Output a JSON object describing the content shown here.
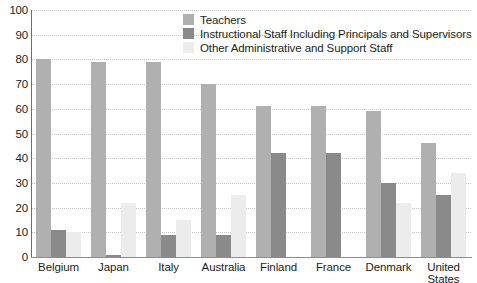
{
  "chart_data": {
    "type": "bar",
    "title": "",
    "xlabel": "",
    "ylabel": "",
    "ylim": [
      0,
      100
    ],
    "yticks": [
      0,
      10,
      20,
      30,
      40,
      50,
      60,
      70,
      80,
      90,
      100
    ],
    "grid": true,
    "legend_position": "top-center",
    "categories": [
      "Belgium",
      "Japan",
      "Italy",
      "Australia",
      "Finland",
      "France",
      "Denmark",
      "United States"
    ],
    "series": [
      {
        "name": "Teachers",
        "color": "#b0b0b0",
        "values": [
          80,
          79,
          79,
          70,
          61,
          61,
          59,
          46
        ]
      },
      {
        "name": "Instructional Staff Including Principals and Supervisors",
        "color": "#8a8a8a",
        "values": [
          11,
          1,
          9,
          9,
          42,
          42,
          30,
          25
        ]
      },
      {
        "name": "Other Administrative and Support Staff",
        "color": "#ececec",
        "values": [
          10,
          22,
          15,
          25,
          0,
          0,
          22,
          34
        ]
      }
    ]
  },
  "axis": {
    "y_tick_labels": [
      "100",
      "90",
      "80",
      "70",
      "60",
      "50",
      "40",
      "30",
      "20",
      "10",
      "0"
    ]
  },
  "x_labels": [
    "Belgium",
    "Japan",
    "Italy",
    "Australia",
    "Finland",
    "France",
    "Denmark",
    "United\nStates"
  ],
  "legend": {
    "items": [
      {
        "label": "Teachers",
        "color": "#b0b0b0"
      },
      {
        "label": "Instructional Staff Including Principals and Supervisors",
        "color": "#8a8a8a"
      },
      {
        "label": "Other Administrative and Support Staff",
        "color": "#ececec"
      }
    ]
  }
}
